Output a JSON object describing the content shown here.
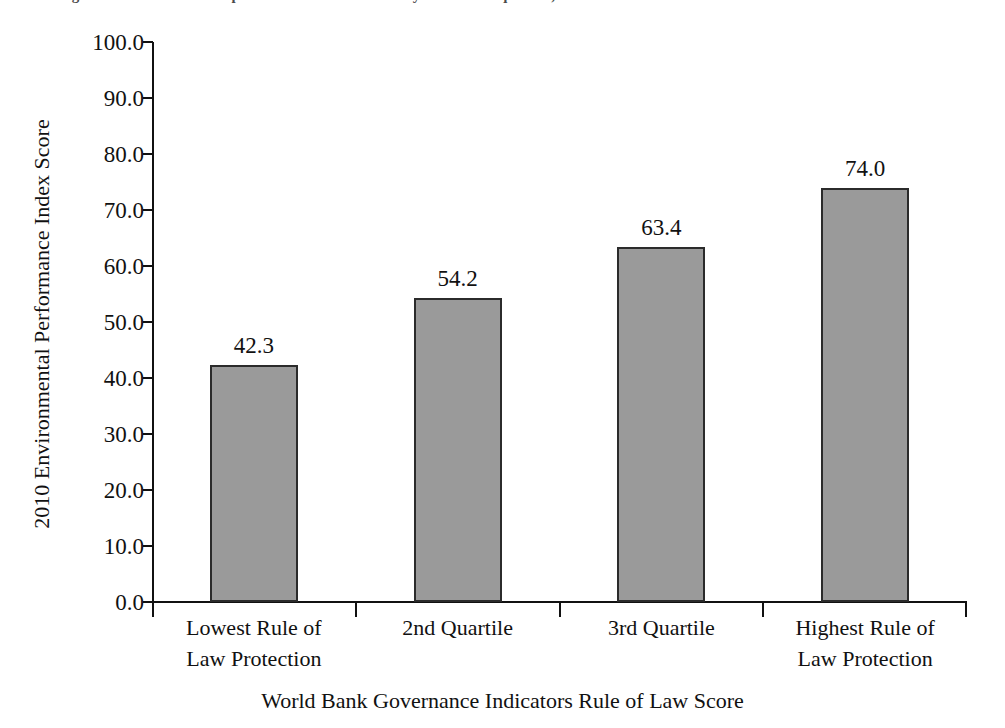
{
  "caption": {
    "text": "Figure 1.1  Environmental performance index scores by rule of law quartile, 2010"
  },
  "chart_data": {
    "type": "bar",
    "title": "",
    "subtitle": "",
    "xlabel": "World Bank Governance Indicators Rule of Law Score",
    "ylabel": "2010 Environmental Performance Index Score",
    "categories": [
      "Lowest Rule of Law Protection",
      "2nd Quartile",
      "3rd Quartile",
      "Highest Rule of Law Protection"
    ],
    "category_lines": [
      [
        "Lowest Rule of",
        "Law Protection"
      ],
      [
        "2nd Quartile",
        ""
      ],
      [
        "3rd Quartile",
        ""
      ],
      [
        "Highest Rule of",
        "Law Protection"
      ]
    ],
    "values": [
      42.3,
      54.2,
      63.4,
      74.0
    ],
    "value_labels": [
      "42.3",
      "54.2",
      "63.4",
      "74.0"
    ],
    "ylim": [
      0,
      100
    ],
    "ytick_values": [
      100,
      90,
      80,
      70,
      60,
      50,
      40,
      30,
      20,
      10,
      0
    ],
    "ytick_labels": [
      "100.0",
      "90.0",
      "80.0",
      "70.0",
      "60.0",
      "50.0",
      "40.0",
      "30.0",
      "20.0",
      "10.0",
      "0.0"
    ],
    "grid": false,
    "legend": null,
    "bar_fill_color": "#9a9a9a",
    "bar_border_color": "#2b2b2b",
    "axis_color": "#111111",
    "background_color": "#ffffff"
  }
}
